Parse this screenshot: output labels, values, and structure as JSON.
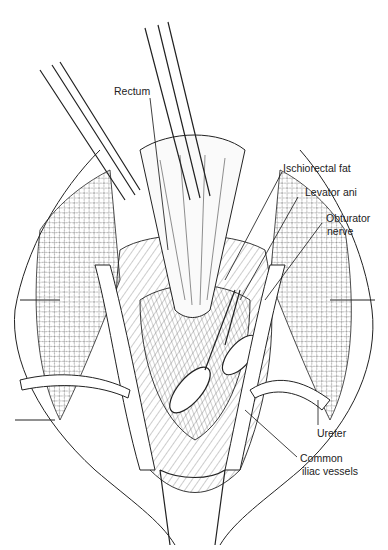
{
  "figure": {
    "type": "surgical anatomical line illustration",
    "labels": {
      "rectum": "Rectum",
      "ischiorectal_fat": "Ischiorectal fat",
      "levator_ani": "Levator ani",
      "obturator_nerve_1": "Obturator",
      "obturator_nerve_2": "nerve",
      "ureter": "Ureter",
      "common_iliac_1": "Common",
      "common_iliac_2": "iliac vessels"
    }
  }
}
